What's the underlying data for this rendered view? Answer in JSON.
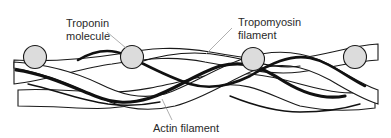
{
  "diagram": {
    "labels": {
      "troponin_line1": "Troponin",
      "troponin_line2": "molecule",
      "tropomyosin_line1": "Tropomyosin",
      "tropomyosin_line2": "filament",
      "actin": "Actin filament"
    },
    "components": [
      {
        "name": "Troponin molecule",
        "shape": "circle",
        "count": 4,
        "color": "#dcdcdc"
      },
      {
        "name": "Tropomyosin filament",
        "shape": "thick-dark-strand",
        "color": "#111111"
      },
      {
        "name": "Actin filament",
        "shape": "twisted-white-strands",
        "color": "#ffffff"
      }
    ],
    "troponin_positions": [
      {
        "cx": 35,
        "cy": 57
      },
      {
        "cx": 132,
        "cy": 57
      },
      {
        "cx": 253,
        "cy": 59
      },
      {
        "cx": 355,
        "cy": 57
      }
    ]
  }
}
